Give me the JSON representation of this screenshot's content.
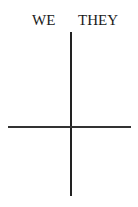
{
  "diagram": {
    "labels": {
      "left": "WE",
      "right": "THEY"
    },
    "colors": {
      "line": "#222222",
      "text": "#1a1a1a",
      "background": "#ffffff"
    }
  }
}
